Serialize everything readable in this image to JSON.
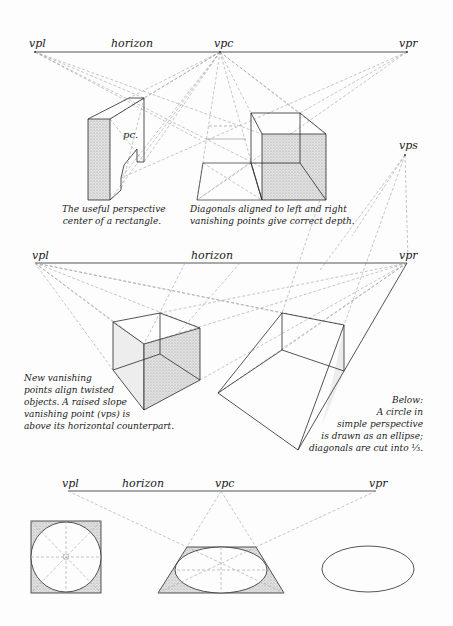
{
  "colors": {
    "ink": "#2a2a2a",
    "guide": "#9a9a9a",
    "shade": "#d9d9d9",
    "paper": "#fdfdfd"
  },
  "section_top": {
    "labels": {
      "vpl": "vpl",
      "horizon": "horizon",
      "vpc": "vpc",
      "vpr": "vpr",
      "vps": "vps",
      "pc": "pc."
    },
    "caption_left": [
      "The useful perspective",
      "center of a rectangle."
    ],
    "caption_right": [
      "Diagonals aligned to left and right",
      "vanishing points give correct depth."
    ]
  },
  "section_middle": {
    "labels": {
      "vpl": "vpl",
      "horizon": "horizon",
      "vpr": "vpr"
    },
    "caption_left": [
      "New vanishing",
      "points align twisted",
      "objects.  A raised slope",
      "vanishing point (vps) is",
      "above its horizontal counterpart."
    ],
    "caption_right": [
      "Below:",
      "A circle in",
      "simple perspective",
      "is drawn as an ellipse;",
      "diagonals are cut into ⅓."
    ]
  },
  "section_bottom": {
    "labels": {
      "vpl": "vpl",
      "horizon": "horizon",
      "vpc": "vpc",
      "vpr": "vpr"
    }
  }
}
